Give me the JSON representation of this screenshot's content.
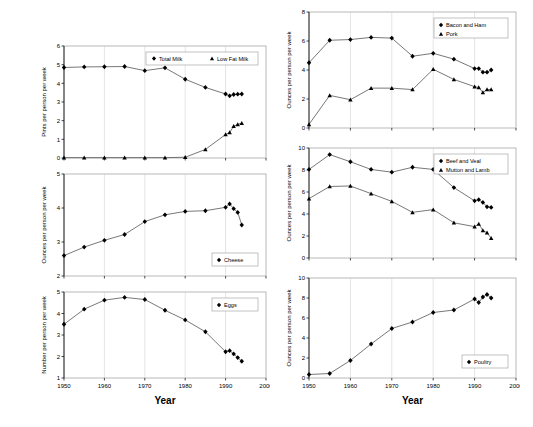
{
  "figure": {
    "title": "",
    "xlabel": "Year",
    "x_tick_labels": [
      "1950",
      "1960",
      "1970",
      "1980",
      "1990",
      "2000"
    ],
    "x_range": [
      1950,
      2000
    ],
    "columns": 2,
    "rows": 3
  },
  "axis_titles": {
    "x": "Year",
    "pints": "Pints per person per week",
    "ounces": "Ounces per person per week",
    "number": "Number per person per week"
  },
  "chart_data": [
    {
      "id": "milk",
      "type": "line",
      "title": "",
      "xlabel": "",
      "ylabel": "Pints per person per week",
      "ylim": [
        0,
        6
      ],
      "y_tick_labels": [
        "0",
        "1",
        "2",
        "3",
        "4",
        "5",
        "6"
      ],
      "xlim": [
        1950,
        2000
      ],
      "x_tick_labels": [
        "1950",
        "1960",
        "1970",
        "1980",
        "1990",
        "2000"
      ],
      "grid": true,
      "legend_position": "top-right",
      "series": [
        {
          "name": "Total Milk",
          "marker": "diamond",
          "x": [
            1950,
            1955,
            1960,
            1965,
            1970,
            1975,
            1980,
            1985,
            1990,
            1991,
            1992,
            1993,
            1994
          ],
          "values": [
            4.85,
            4.88,
            4.89,
            4.9,
            4.68,
            4.83,
            4.22,
            3.78,
            3.43,
            3.33,
            3.4,
            3.42,
            3.43
          ]
        },
        {
          "name": "Low Fat Milk",
          "marker": "triangle",
          "x": [
            1950,
            1955,
            1960,
            1965,
            1970,
            1975,
            1980,
            1985,
            1990,
            1991,
            1992,
            1993,
            1994
          ],
          "values": [
            0.02,
            0.02,
            0.02,
            0.02,
            0.02,
            0.02,
            0.04,
            0.46,
            1.26,
            1.37,
            1.7,
            1.8,
            1.87
          ]
        }
      ]
    },
    {
      "id": "bacon-pork",
      "type": "line",
      "title": "",
      "xlabel": "",
      "ylabel": "Ounces per person per week",
      "ylim": [
        0,
        8
      ],
      "y_tick_labels": [
        "0",
        "2",
        "4",
        "6",
        "8"
      ],
      "xlim": [
        1950,
        2000
      ],
      "x_tick_labels": [
        "1950",
        "1960",
        "1970",
        "1980",
        "1990",
        "2000"
      ],
      "grid": true,
      "legend_position": "top-right",
      "series": [
        {
          "name": "Bacon and Ham",
          "marker": "diamond",
          "x": [
            1950,
            1955,
            1960,
            1965,
            1970,
            1975,
            1980,
            1985,
            1990,
            1991,
            1992,
            1993,
            1994
          ],
          "values": [
            4.5,
            6.05,
            6.1,
            6.25,
            6.2,
            4.95,
            5.15,
            4.75,
            4.1,
            4.1,
            3.85,
            3.85,
            4.0
          ]
        },
        {
          "name": "Pork",
          "marker": "triangle",
          "x": [
            1950,
            1955,
            1960,
            1965,
            1970,
            1975,
            1980,
            1985,
            1990,
            1991,
            1992,
            1993,
            1994
          ],
          "values": [
            0.25,
            2.25,
            1.95,
            2.75,
            2.75,
            2.65,
            4.05,
            3.35,
            2.85,
            2.8,
            2.45,
            2.65,
            2.65
          ]
        }
      ]
    },
    {
      "id": "cheese",
      "type": "line",
      "title": "",
      "xlabel": "",
      "ylabel": "Ounces per person per week",
      "ylim": [
        2,
        5
      ],
      "y_tick_labels": [
        "2",
        "3",
        "4",
        "5"
      ],
      "xlim": [
        1950,
        2000
      ],
      "x_tick_labels": [
        "1950",
        "1960",
        "1970",
        "1980",
        "1990",
        "2000"
      ],
      "grid": true,
      "legend_position": "bottom-right",
      "series": [
        {
          "name": "Cheese",
          "marker": "diamond",
          "x": [
            1950,
            1955,
            1960,
            1965,
            1970,
            1975,
            1980,
            1985,
            1990,
            1991,
            1992,
            1993,
            1994
          ],
          "values": [
            2.6,
            2.85,
            3.05,
            3.22,
            3.6,
            3.8,
            3.9,
            3.92,
            4.02,
            4.12,
            3.98,
            3.87,
            3.5
          ]
        }
      ]
    },
    {
      "id": "beef-mutton",
      "type": "line",
      "title": "",
      "xlabel": "",
      "ylabel": "Ounces per person per week",
      "ylim": [
        0,
        10
      ],
      "y_tick_labels": [
        "0",
        "2",
        "4",
        "6",
        "8",
        "10"
      ],
      "xlim": [
        1950,
        2000
      ],
      "x_tick_labels": [
        "1950",
        "1960",
        "1970",
        "1980",
        "1990",
        "2000"
      ],
      "grid": true,
      "legend_position": "top-right",
      "series": [
        {
          "name": "Beef and Veal",
          "marker": "diamond",
          "x": [
            1950,
            1955,
            1960,
            1965,
            1970,
            1975,
            1980,
            1985,
            1990,
            1991,
            1992,
            1993,
            1994
          ],
          "values": [
            8.05,
            9.4,
            8.75,
            8.05,
            7.8,
            8.25,
            8.05,
            6.4,
            5.2,
            5.3,
            5.05,
            4.65,
            4.6
          ]
        },
        {
          "name": "Mutton and Lamb",
          "marker": "triangle",
          "x": [
            1950,
            1955,
            1960,
            1965,
            1970,
            1975,
            1980,
            1985,
            1990,
            1991,
            1992,
            1993,
            1994
          ],
          "values": [
            5.4,
            6.5,
            6.55,
            5.85,
            5.15,
            4.15,
            4.4,
            3.2,
            2.85,
            3.1,
            2.5,
            2.3,
            1.8
          ]
        }
      ]
    },
    {
      "id": "eggs",
      "type": "line",
      "title": "",
      "xlabel": "Year",
      "ylabel": "Number per person per week",
      "ylim": [
        1,
        5
      ],
      "y_tick_labels": [
        "1",
        "2",
        "3",
        "4",
        "5"
      ],
      "xlim": [
        1950,
        2000
      ],
      "x_tick_labels": [
        "1950",
        "1960",
        "1970",
        "1980",
        "1990",
        "2000"
      ],
      "grid": true,
      "legend_position": "top-right",
      "series": [
        {
          "name": "Eggs",
          "marker": "diamond",
          "x": [
            1950,
            1955,
            1960,
            1965,
            1970,
            1975,
            1980,
            1985,
            1990,
            1991,
            1992,
            1993,
            1994
          ],
          "values": [
            3.5,
            4.2,
            4.62,
            4.75,
            4.65,
            4.15,
            3.7,
            3.15,
            2.22,
            2.27,
            2.12,
            1.95,
            1.78
          ]
        }
      ]
    },
    {
      "id": "poultry",
      "type": "line",
      "title": "",
      "xlabel": "Year",
      "ylabel": "Ounces per person per week",
      "ylim": [
        0,
        10
      ],
      "y_tick_labels": [
        "0",
        "2",
        "4",
        "6",
        "8",
        "10"
      ],
      "xlim": [
        1950,
        2000
      ],
      "x_tick_labels": [
        "1950",
        "1960",
        "1970",
        "1980",
        "1990",
        "2000"
      ],
      "grid": true,
      "legend_position": "bottom-right",
      "series": [
        {
          "name": "Poultry",
          "marker": "diamond",
          "x": [
            1950,
            1955,
            1960,
            1965,
            1970,
            1975,
            1980,
            1985,
            1990,
            1991,
            1992,
            1993,
            1994
          ],
          "values": [
            0.35,
            0.45,
            1.75,
            3.4,
            4.95,
            5.6,
            6.55,
            6.8,
            7.9,
            7.55,
            8.1,
            8.35,
            8.0
          ]
        }
      ]
    }
  ],
  "panels": [
    {
      "id": "milk",
      "x": 38,
      "y": 40,
      "w": 232,
      "h": 128,
      "show_xlabels": false,
      "show_xtitle": false
    },
    {
      "id": "cheese",
      "x": 38,
      "y": 168,
      "w": 232,
      "h": 118,
      "show_xlabels": false,
      "show_xtitle": false
    },
    {
      "id": "eggs",
      "x": 38,
      "y": 286,
      "w": 232,
      "h": 126,
      "show_xlabels": true,
      "show_xtitle": true
    },
    {
      "id": "bacon-pork",
      "x": 283,
      "y": 6,
      "w": 237,
      "h": 132,
      "show_xlabels": false,
      "show_xtitle": false
    },
    {
      "id": "beef-mutton",
      "x": 283,
      "y": 142,
      "w": 237,
      "h": 126,
      "show_xlabels": false,
      "show_xtitle": false
    },
    {
      "id": "poultry",
      "x": 283,
      "y": 272,
      "w": 237,
      "h": 140,
      "show_xlabels": true,
      "show_xtitle": true
    }
  ],
  "colors": {
    "marker": "#000000",
    "line": "#555555",
    "grid": "#c8c8c8",
    "frame": "#9a9a9a",
    "background": "#ffffff"
  }
}
